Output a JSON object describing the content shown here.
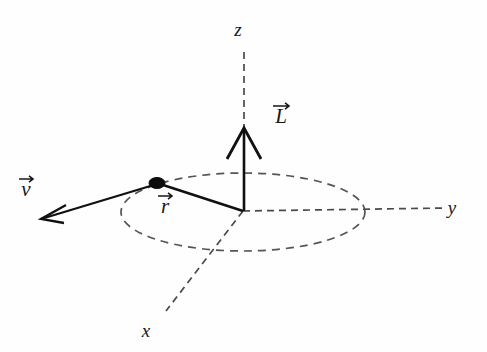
{
  "figure": {
    "background_color": "#fefefe",
    "ink_color": "#101010",
    "dash_color": "#4a4a4a",
    "width": 487,
    "height": 352
  },
  "axes": [
    {
      "name": "z",
      "label": "z",
      "label_x": 238,
      "label_y": 36,
      "line": {
        "x1": 244,
        "y1": 52,
        "x2": 244,
        "y2": 130
      },
      "style": "dashed"
    },
    {
      "name": "y",
      "label": "y",
      "label_x": 452,
      "label_y": 214,
      "line": {
        "x1": 243,
        "y1": 211,
        "x2": 446,
        "y2": 208
      },
      "style": "dashed"
    },
    {
      "name": "x",
      "label": "x",
      "label_x": 146,
      "label_y": 337,
      "line": {
        "x1": 243,
        "y1": 211,
        "x2": 166,
        "y2": 311
      },
      "style": "dashed"
    }
  ],
  "orbit": {
    "name": "circular-orbit-path",
    "center_x": 243,
    "center_y": 212,
    "radius_x": 122,
    "radius_y": 39,
    "style": "dashed"
  },
  "origin": {
    "x": 243,
    "y": 211
  },
  "particle": {
    "name": "orbiting-particle",
    "x": 157,
    "y": 183,
    "radius_x": 8,
    "radius_y": 5.5
  },
  "vectors": [
    {
      "name": "angular-momentum-vector",
      "symbol": "L",
      "label": "L",
      "label_x": 281,
      "label_y": 123,
      "accent": "vector-arrow-overbar",
      "tail": {
        "x": 244,
        "y": 211
      },
      "tip": {
        "x": 244,
        "y": 128
      },
      "arrowhead": {
        "left_x": 227,
        "left_y": 159,
        "right_x": 261,
        "right_y": 159
      },
      "style": "solid"
    },
    {
      "name": "radius-vector",
      "symbol": "r",
      "label": "r",
      "label_x": 165,
      "label_y": 213,
      "accent": "vector-arrow-overbar",
      "tail": {
        "x": 243,
        "y": 211
      },
      "tip": {
        "x": 160,
        "y": 184
      },
      "style": "solid"
    },
    {
      "name": "velocity-vector",
      "symbol": "v",
      "label": "v",
      "label_x": 26,
      "label_y": 196,
      "accent": "vector-arrow-overbar",
      "tail": {
        "x": 157,
        "y": 184
      },
      "tip": {
        "x": 41,
        "y": 219
      },
      "arrowhead": {
        "wing1_x": 66,
        "wing1_y": 205,
        "wing2_x": 64,
        "wing2_y": 223
      },
      "style": "solid"
    }
  ]
}
